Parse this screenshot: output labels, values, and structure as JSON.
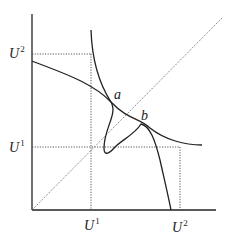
{
  "diagram": {
    "type": "economics-utility-diagram",
    "axes": {
      "x_label": "",
      "y_label": ""
    },
    "labels": {
      "y_u2": {
        "base": "U",
        "sup": "2"
      },
      "y_u1": {
        "base": "U",
        "sup": "1"
      },
      "x_u1": {
        "base": "U",
        "sup": "1"
      },
      "x_u2": {
        "base": "U",
        "sup": "2"
      },
      "point_a": "a",
      "point_b": "b"
    },
    "colors": {
      "line": "#222222",
      "dotted": "#444444",
      "background": "#ffffff"
    }
  }
}
